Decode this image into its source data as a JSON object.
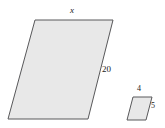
{
  "figure": {
    "background_color": "#ffffff",
    "shape_fill_color": "#e8e8e8",
    "shape_stroke_color": "#58585a",
    "label_color": "#1a1a1a"
  },
  "shapes": {
    "large_parallelogram": {
      "name": "large-parallelogram",
      "points": "35,20 113,20 88,119 8,119",
      "top_label": "x",
      "right_label": "20"
    },
    "small_parallelogram": {
      "name": "small-parallelogram",
      "points": "133,97 152,97 146,120 127,120",
      "top_label": "4",
      "right_label": "5"
    }
  },
  "chart_data": {
    "type": "diagram",
    "figures": [
      {
        "name": "large parallelogram",
        "labels": [
          {
            "side": "top",
            "value": "x",
            "is_unknown": true
          },
          {
            "side": "right",
            "value": "20",
            "is_unknown": false
          }
        ]
      },
      {
        "name": "small parallelogram",
        "labels": [
          {
            "side": "top",
            "value": "4",
            "is_unknown": false
          },
          {
            "side": "right",
            "value": "5",
            "is_unknown": false
          }
        ]
      }
    ]
  }
}
